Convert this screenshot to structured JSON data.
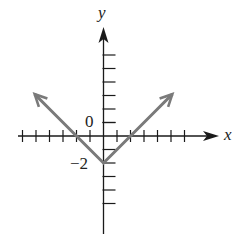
{
  "chart_data": {
    "type": "line",
    "title": "",
    "function": "y = |x| - 2",
    "xlabel": "x",
    "ylabel": "y",
    "tick_labels": [
      {
        "axis": "y",
        "value": 0,
        "text": "0"
      },
      {
        "axis": "y",
        "value": -2,
        "text": "−2"
      }
    ],
    "x_ticks": [
      -6,
      -5,
      -4,
      -3,
      -2,
      -1,
      1,
      2,
      3,
      4,
      5,
      6
    ],
    "y_ticks": [
      -5,
      -4,
      -3,
      -2,
      -1,
      1,
      2,
      3,
      4,
      5,
      6
    ],
    "xlim": [
      -6.5,
      8.5
    ],
    "ylim": [
      -7,
      8
    ],
    "grid": false,
    "series": [
      {
        "name": "y = |x| - 2",
        "x": [
          -5.1,
          -4,
          -3,
          -2,
          -1,
          0,
          1,
          2,
          3,
          4,
          5.1
        ],
        "y": [
          3.1,
          2,
          1,
          0,
          -1,
          -2,
          -1,
          0,
          1,
          2,
          3.1
        ],
        "vertex": [
          0,
          -2
        ],
        "x_intercepts": [
          -2,
          2
        ],
        "arrows_both_ends": true,
        "color": "#7a7a7a"
      }
    ],
    "axis_color": "#1a1a1a"
  },
  "labels": {
    "x_axis": "x",
    "y_axis": "y",
    "zero": "0",
    "minus_two": "−2"
  }
}
